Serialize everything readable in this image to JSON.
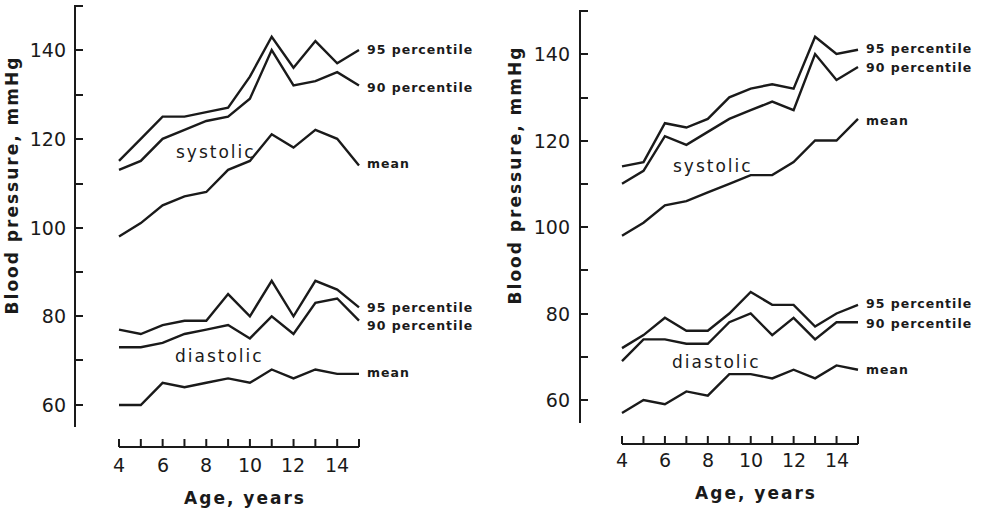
{
  "chart_data": [
    {
      "type": "line",
      "panel": "left",
      "title": "",
      "xlabel": "Age, years",
      "ylabel": "Blood pressure, mmHg",
      "x": [
        4,
        5,
        6,
        7,
        8,
        9,
        10,
        11,
        12,
        13,
        14,
        15
      ],
      "xticks": [
        4,
        6,
        8,
        10,
        12,
        14
      ],
      "yticks": [
        60,
        80,
        100,
        120,
        140
      ],
      "ylim": [
        55,
        150
      ],
      "grid": false,
      "group_labels": [
        "systolic",
        "diastolic"
      ],
      "series": [
        {
          "name": "systolic 95 percentile",
          "group": "systolic",
          "label": "95 percentile",
          "values": [
            115,
            120,
            125,
            125,
            126,
            127,
            134,
            143,
            136,
            142,
            137,
            140
          ]
        },
        {
          "name": "systolic 90 percentile",
          "group": "systolic",
          "label": "90 percentile",
          "values": [
            113,
            115,
            120,
            122,
            124,
            125,
            129,
            140,
            132,
            133,
            135,
            132
          ]
        },
        {
          "name": "systolic mean",
          "group": "systolic",
          "label": "mean",
          "values": [
            98,
            101,
            105,
            107,
            108,
            113,
            115,
            121,
            118,
            122,
            120,
            114
          ]
        },
        {
          "name": "diastolic 95 percentile",
          "group": "diastolic",
          "label": "95 percentile",
          "values": [
            77,
            76,
            78,
            79,
            79,
            85,
            80,
            88,
            80,
            88,
            86,
            82
          ]
        },
        {
          "name": "diastolic 90 percentile",
          "group": "diastolic",
          "label": "90 percentile",
          "values": [
            73,
            73,
            74,
            76,
            77,
            78,
            75,
            80,
            76,
            83,
            84,
            79
          ]
        },
        {
          "name": "diastolic mean",
          "group": "diastolic",
          "label": "mean",
          "values": [
            60,
            60,
            65,
            64,
            65,
            66,
            65,
            68,
            66,
            68,
            67,
            67
          ]
        }
      ]
    },
    {
      "type": "line",
      "panel": "right",
      "title": "",
      "xlabel": "Age, years",
      "ylabel": "Blood pressure, mmHg",
      "x": [
        4,
        5,
        6,
        7,
        8,
        9,
        10,
        11,
        12,
        13,
        14,
        15
      ],
      "xticks": [
        4,
        6,
        8,
        10,
        12,
        14
      ],
      "yticks": [
        60,
        80,
        100,
        120,
        140
      ],
      "ylim": [
        55,
        150
      ],
      "grid": false,
      "group_labels": [
        "systolic",
        "diastolic"
      ],
      "series": [
        {
          "name": "systolic 95 percentile",
          "group": "systolic",
          "label": "95 percentile",
          "values": [
            114,
            115,
            124,
            123,
            125,
            130,
            132,
            133,
            132,
            144,
            140,
            141
          ]
        },
        {
          "name": "systolic 90 percentile",
          "group": "systolic",
          "label": "90 percentile",
          "values": [
            110,
            113,
            121,
            119,
            122,
            125,
            127,
            129,
            127,
            140,
            134,
            137
          ]
        },
        {
          "name": "systolic mean",
          "group": "systolic",
          "label": "mean",
          "values": [
            98,
            101,
            105,
            106,
            108,
            110,
            112,
            112,
            115,
            120,
            120,
            125
          ]
        },
        {
          "name": "diastolic 95 percentile",
          "group": "diastolic",
          "label": "95 percentile",
          "values": [
            72,
            75,
            79,
            76,
            76,
            80,
            85,
            82,
            82,
            77,
            80,
            82
          ]
        },
        {
          "name": "diastolic 90 percentile",
          "group": "diastolic",
          "label": "90 percentile",
          "values": [
            69,
            74,
            74,
            73,
            73,
            78,
            80,
            75,
            79,
            74,
            78,
            78
          ]
        },
        {
          "name": "diastolic mean",
          "group": "diastolic",
          "label": "mean",
          "values": [
            57,
            60,
            59,
            62,
            61,
            66,
            66,
            65,
            67,
            65,
            68,
            67
          ]
        }
      ]
    }
  ],
  "panels": [
    {
      "ylabel": "Blood pressure, mmHg",
      "xlabel": "Age, years",
      "ytick_labels": [
        "140",
        "120",
        "100",
        "80",
        "60"
      ],
      "xtick_labels": [
        "4",
        "6",
        "8",
        "10",
        "12",
        "14"
      ],
      "labels": {
        "sys_95": "95 percentile",
        "sys_90": "90 percentile",
        "sys_mean": "mean",
        "dia_95": "95 percentile",
        "dia_90": "90 percentile",
        "dia_mean": "mean",
        "systolic": "systolic",
        "diastolic": "diastolic"
      }
    },
    {
      "ylabel": "Blood pressure, mmHg",
      "xlabel": "Age, years",
      "ytick_labels": [
        "140",
        "120",
        "100",
        "80",
        "60"
      ],
      "xtick_labels": [
        "4",
        "6",
        "8",
        "10",
        "12",
        "14"
      ],
      "labels": {
        "sys_95": "95 percentile",
        "sys_90": "90 percentile",
        "sys_mean": "mean",
        "dia_95": "95 percentile",
        "dia_90": "90 percentile",
        "dia_mean": "mean",
        "systolic": "systolic",
        "diastolic": "diastolic"
      }
    }
  ]
}
